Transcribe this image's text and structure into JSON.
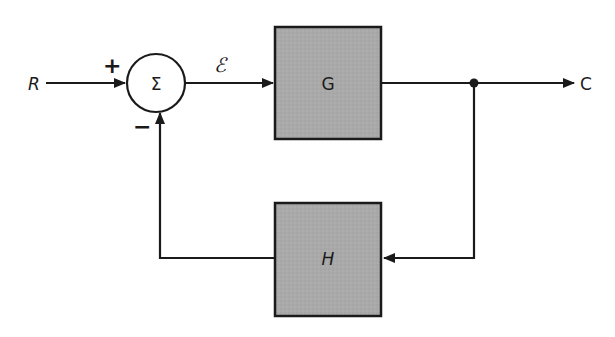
{
  "diagram": {
    "type": "negative-feedback-control-loop",
    "colors": {
      "line": "#1a1a1a",
      "block_fill": "#a9a9a9",
      "block_stroke": "#1a1a1a",
      "background": "#ffffff"
    },
    "input": {
      "label": "R"
    },
    "summing_junction": {
      "symbol": "Σ",
      "plus_sign": "+",
      "minus_sign": "−"
    },
    "error_signal": {
      "label": "ℰ"
    },
    "forward_block": {
      "label": "G"
    },
    "feedback_block": {
      "label": "H"
    },
    "output": {
      "label": "C"
    }
  }
}
